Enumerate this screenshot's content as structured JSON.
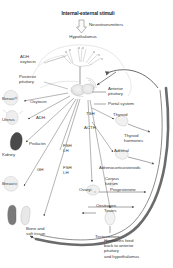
{
  "figure": {
    "title": "Internal-external stimuli",
    "type": "anatomical-flow-diagram",
    "background_color": "#ffffff",
    "ink_color": "#3a3a3a",
    "arrow_color": "#5a5a5a",
    "feedback_arc_color": "#555555"
  },
  "labels": {
    "stimuli": "Internal-external stimuli",
    "neurotransmitters": "Neurotransmitters",
    "hypothalamus": "Hypothalamus",
    "adh_oxytocin": "ADH\noxytocin",
    "posterior_pituitary": "Posterior\npituitary",
    "anterior_pituitary": "Anterior\npituitary",
    "portal_system": "Portal system",
    "breast_upper": "Breast",
    "oxytocin": "Oxytocin",
    "uterus": "Uterus",
    "adh": "ADH",
    "kidney": "Kidney",
    "prolactin": "Prolactin",
    "breast_lower": "Breast",
    "fsh_lh_upper": "FSH\nLH",
    "fsh_lh_lower": "FSH\nLH",
    "gh": "GH",
    "tsh": "TSH",
    "acth": "ACTH",
    "thyroid": "Thyroid",
    "thyroid_hormones": "Thyroid\nhormones",
    "adrenal": "Adrenal",
    "adrenocorticosteroids": "Adrenocorticosteroids",
    "ovary": "Ovary",
    "corpus_luteum": "Corpus\nluteum",
    "progesterone": "Progesterone",
    "oestrogen": "Oestrogen",
    "testes": "Testes",
    "testosterone": "Testosterone",
    "bone_soft_tissue": "Bone and\nsoft tissue",
    "feedback": "Hormones feed\nback to anterior\npituitary\nand hypothalamus"
  },
  "organs": [
    {
      "name": "breast-upper",
      "label": "Breast"
    },
    {
      "name": "uterus",
      "label": "Uterus"
    },
    {
      "name": "kidney",
      "label": "Kidney"
    },
    {
      "name": "breast-lower",
      "label": "Breast"
    },
    {
      "name": "bone-soft-tissue",
      "label": "Bone and soft tissue"
    },
    {
      "name": "testes",
      "label": "Testes"
    },
    {
      "name": "ovary",
      "label": "Ovary"
    },
    {
      "name": "thyroid",
      "label": "Thyroid"
    },
    {
      "name": "adrenal",
      "label": "Adrenal"
    }
  ],
  "hormones": [
    {
      "name": "oxytocin",
      "label": "Oxytocin"
    },
    {
      "name": "adh",
      "label": "ADH"
    },
    {
      "name": "prolactin",
      "label": "Prolactin"
    },
    {
      "name": "fsh-lh",
      "label": "FSH LH"
    },
    {
      "name": "gh",
      "label": "GH"
    },
    {
      "name": "tsh",
      "label": "TSH"
    },
    {
      "name": "acth",
      "label": "ACTH"
    },
    {
      "name": "thyroid-hormones",
      "label": "Thyroid hormones"
    },
    {
      "name": "adrenocorticosteroids",
      "label": "Adrenocorticosteroids"
    },
    {
      "name": "progesterone",
      "label": "Progesterone"
    },
    {
      "name": "oestrogen",
      "label": "Oestrogen"
    },
    {
      "name": "testosterone",
      "label": "Testosterone"
    }
  ]
}
